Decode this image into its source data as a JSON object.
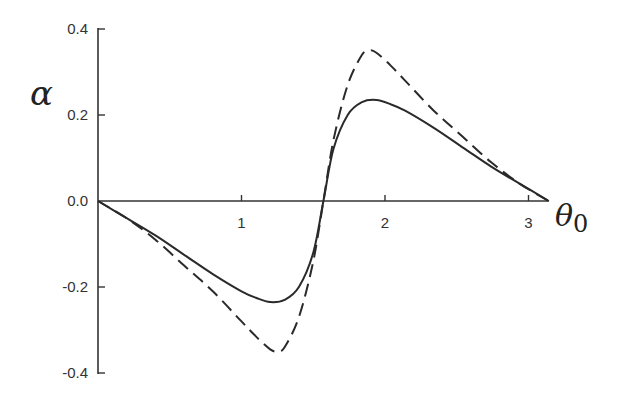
{
  "chart_data": {
    "type": "line",
    "title": "",
    "xlabel": "θ0",
    "ylabel": "α",
    "xlim": [
      0,
      3.1416
    ],
    "ylim": [
      -0.4,
      0.4
    ],
    "x_ticks": [
      "1",
      "2",
      "3"
    ],
    "y_ticks": [
      "0.4",
      "0.2",
      "0.0",
      "-0.2",
      "-0.4"
    ],
    "grid": false,
    "legend": null,
    "series": [
      {
        "name": "solid",
        "style": "solid",
        "x": [
          0,
          0.2,
          0.4,
          0.6,
          0.8,
          1.0,
          1.1,
          1.2,
          1.3,
          1.4,
          1.5,
          1.571,
          1.64,
          1.74,
          1.84,
          1.94,
          2.04,
          2.14,
          2.34,
          2.54,
          2.74,
          2.94,
          3.1416
        ],
        "y": [
          0,
          -0.04,
          -0.08,
          -0.125,
          -0.17,
          -0.21,
          -0.225,
          -0.235,
          -0.23,
          -0.2,
          -0.12,
          0,
          0.12,
          0.2,
          0.23,
          0.235,
          0.225,
          0.21,
          0.17,
          0.125,
          0.08,
          0.04,
          0
        ]
      },
      {
        "name": "dashed",
        "style": "dashed",
        "x": [
          0,
          0.2,
          0.4,
          0.6,
          0.8,
          1.0,
          1.1,
          1.2,
          1.25,
          1.3,
          1.4,
          1.5,
          1.571,
          1.64,
          1.74,
          1.84,
          1.89,
          1.94,
          2.04,
          2.14,
          2.34,
          2.54,
          2.74,
          2.94,
          3.1416
        ],
        "y": [
          0,
          -0.04,
          -0.09,
          -0.15,
          -0.21,
          -0.28,
          -0.315,
          -0.345,
          -0.35,
          -0.34,
          -0.27,
          -0.14,
          0,
          0.14,
          0.27,
          0.34,
          0.35,
          0.345,
          0.315,
          0.28,
          0.21,
          0.15,
          0.09,
          0.04,
          0
        ]
      }
    ]
  },
  "labels": {
    "y_axis_symbol": "α",
    "x_axis_symbol": "θ",
    "x_axis_subscript": "0"
  }
}
